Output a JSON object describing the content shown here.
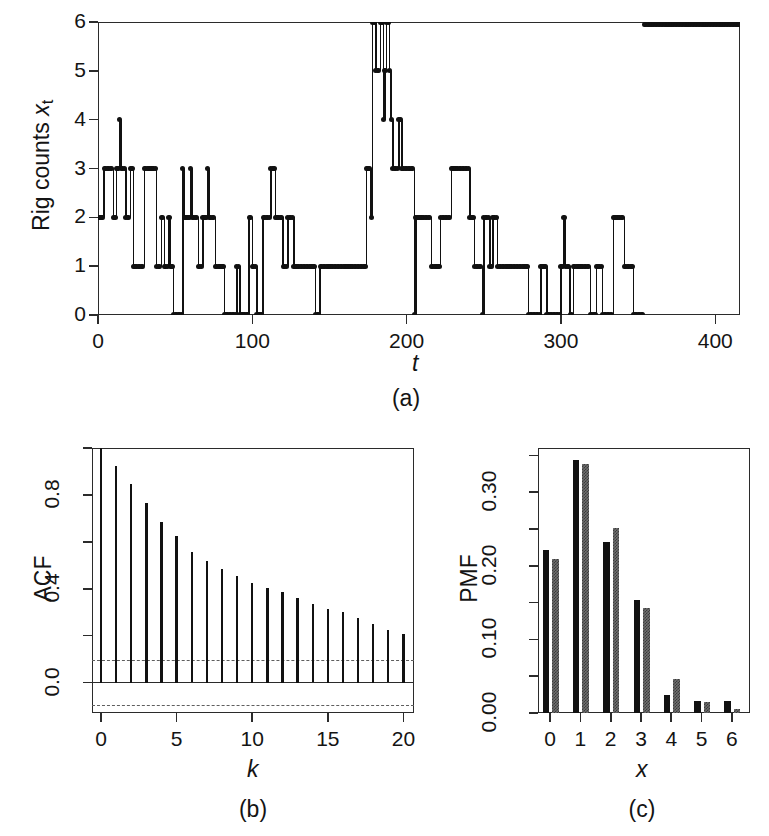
{
  "figure": {
    "panels": [
      "(a)",
      "(b)",
      "(c)"
    ]
  },
  "panel_a": {
    "caption": "(a)",
    "ylabel_main": "Rig counts ",
    "ylabel_var": "x",
    "ylabel_sub": "t",
    "xlabel": "t",
    "yticks": [
      "0",
      "1",
      "2",
      "3",
      "4",
      "5",
      "6"
    ],
    "xticks": [
      "0",
      "100",
      "200",
      "300",
      "400"
    ]
  },
  "panel_b": {
    "caption": "(b)",
    "ylabel": "ACF",
    "xlabel": "k",
    "yticks": [
      "0.0",
      "0.4",
      "0.8"
    ],
    "xticks": [
      "0",
      "5",
      "10",
      "15",
      "20"
    ]
  },
  "panel_c": {
    "caption": "(c)",
    "ylabel": "PMF",
    "xlabel": "x",
    "yticks": [
      "0.00",
      "0.10",
      "0.20",
      "0.30"
    ],
    "xticks": [
      "0",
      "1",
      "2",
      "3",
      "4",
      "5",
      "6"
    ]
  },
  "colors": {
    "observed": "#111111",
    "fitted": "#6f6f6f",
    "axis": "#2b2b2b",
    "confidence": "#5e5e5e",
    "background": "#ffffff"
  },
  "chart_data": [
    {
      "type": "line",
      "id": "rig-counts-time-series",
      "title": "",
      "xlabel": "t",
      "ylabel": "Rig counts x_t",
      "xlim": [
        0,
        416
      ],
      "ylim": [
        0,
        6
      ],
      "grid": false,
      "legend": "none",
      "style": "stem-with-points",
      "x": [
        1,
        2,
        3,
        4,
        5,
        6,
        7,
        8,
        9,
        10,
        11,
        12,
        13,
        14,
        15,
        16,
        17,
        18,
        19,
        20,
        21,
        22,
        23,
        24,
        25,
        26,
        27,
        28,
        29,
        30,
        31,
        32,
        33,
        34,
        35,
        36,
        37,
        38,
        39,
        40,
        41,
        42,
        43,
        44,
        45,
        46,
        47,
        48,
        49,
        50,
        51,
        52,
        53,
        54,
        55,
        56,
        57,
        58,
        59,
        60,
        61,
        62,
        63,
        64,
        65,
        66,
        67,
        68,
        69,
        70,
        71,
        72,
        73,
        74,
        75,
        76,
        77,
        78,
        79,
        80,
        81,
        82,
        83,
        84,
        85,
        86,
        87,
        88,
        89,
        90,
        91,
        92,
        93,
        94,
        95,
        96,
        97,
        98,
        99,
        100,
        101,
        102,
        103,
        104,
        105,
        106,
        107,
        108,
        109,
        110,
        111,
        112,
        113,
        114,
        115,
        116,
        117,
        118,
        119,
        120,
        121,
        122,
        123,
        124,
        125,
        126,
        127,
        128,
        129,
        130,
        131,
        132,
        133,
        134,
        135,
        136,
        137,
        138,
        139,
        140,
        141,
        142,
        143,
        144,
        145,
        146,
        147,
        148,
        149,
        150,
        151,
        152,
        153,
        154,
        155,
        156,
        157,
        158,
        159,
        160,
        161,
        162,
        163,
        164,
        165,
        166,
        167,
        168,
        169,
        170,
        171,
        172,
        173,
        174,
        175,
        176,
        177,
        178,
        179,
        180,
        181,
        182,
        183,
        184,
        185,
        186,
        187,
        188,
        189,
        190,
        191,
        192,
        193,
        194,
        195,
        196,
        197,
        198,
        199,
        200,
        201,
        202,
        203,
        204,
        205,
        206,
        207,
        208,
        209,
        210,
        211,
        212,
        213,
        214,
        215,
        216,
        217,
        218,
        219,
        220,
        221,
        222,
        223,
        224,
        225,
        226,
        227,
        228,
        229,
        230,
        231,
        232,
        233,
        234,
        235,
        236,
        237,
        238,
        239,
        240,
        241,
        242,
        243,
        244,
        245,
        246,
        247,
        248,
        249,
        250,
        251,
        252,
        253,
        254,
        255,
        256,
        257,
        258,
        259,
        260,
        261,
        262,
        263,
        264,
        265,
        266,
        267,
        268,
        269,
        270,
        271,
        272,
        273,
        274,
        275,
        276,
        277,
        278,
        279,
        280,
        281,
        282,
        283,
        284,
        285,
        286,
        287,
        288,
        289,
        290,
        291,
        292,
        293,
        294,
        295,
        296,
        297,
        298,
        299,
        300,
        301,
        302,
        303,
        304,
        305,
        306,
        307,
        308,
        309,
        310,
        311,
        312,
        313,
        314,
        315,
        316,
        317,
        318,
        319,
        320,
        321,
        322,
        323,
        324,
        325,
        326,
        327,
        328,
        329,
        330,
        331,
        332,
        333,
        334,
        335,
        336,
        337,
        338,
        339,
        340,
        341,
        342,
        343,
        344,
        345,
        346,
        347,
        348,
        349,
        350,
        351,
        352,
        353,
        354,
        355,
        356,
        357,
        358,
        359,
        360,
        361,
        362,
        363,
        364,
        365,
        366,
        367,
        368,
        369,
        370,
        371,
        372,
        373,
        374,
        375,
        376,
        377,
        378,
        379,
        380,
        381,
        382,
        383,
        384,
        385,
        386,
        387,
        388,
        389,
        390,
        391,
        392,
        393,
        394,
        395,
        396,
        397,
        398,
        399,
        400,
        401,
        402,
        403,
        404,
        405,
        406,
        407,
        408,
        409,
        410,
        411,
        412,
        413,
        414,
        415,
        416
      ],
      "y": [
        2,
        2,
        2,
        3,
        3,
        3,
        3,
        3,
        3,
        2,
        2,
        3,
        3,
        4,
        3,
        3,
        3,
        2,
        2,
        2,
        3,
        3,
        1,
        1,
        1,
        1,
        1,
        1,
        1,
        3,
        3,
        3,
        3,
        3,
        3,
        3,
        3,
        1,
        1,
        1,
        2,
        2,
        1,
        1,
        1,
        2,
        1,
        1,
        0,
        0,
        0,
        0,
        0,
        0,
        3,
        2,
        2,
        2,
        2,
        3,
        2,
        2,
        2,
        2,
        1,
        1,
        1,
        2,
        2,
        2,
        3,
        2,
        2,
        2,
        2,
        1,
        1,
        1,
        1,
        1,
        1,
        0,
        0,
        0,
        0,
        0,
        0,
        0,
        0,
        1,
        1,
        0,
        0,
        0,
        0,
        0,
        0,
        2,
        2,
        1,
        1,
        1,
        0,
        0,
        0,
        0,
        2,
        2,
        2,
        2,
        2,
        3,
        3,
        3,
        2,
        2,
        2,
        2,
        2,
        1,
        1,
        1,
        2,
        2,
        2,
        2,
        1,
        1,
        1,
        1,
        1,
        1,
        1,
        1,
        1,
        1,
        1,
        1,
        1,
        1,
        0,
        0,
        0,
        1,
        1,
        1,
        1,
        1,
        1,
        1,
        1,
        1,
        1,
        1,
        1,
        1,
        1,
        1,
        1,
        1,
        1,
        1,
        1,
        1,
        1,
        1,
        1,
        1,
        1,
        1,
        1,
        1,
        1,
        3,
        3,
        3,
        2,
        6,
        6,
        5,
        5,
        5,
        6,
        6,
        4,
        5,
        6,
        6,
        5,
        4,
        3,
        3,
        3,
        3,
        4,
        4,
        3,
        3,
        3,
        3,
        3,
        3,
        3,
        3,
        0,
        2,
        2,
        2,
        2,
        2,
        2,
        2,
        2,
        2,
        2,
        1,
        1,
        1,
        1,
        1,
        1,
        2,
        2,
        2,
        2,
        2,
        2,
        2,
        3,
        3,
        3,
        3,
        3,
        3,
        3,
        3,
        3,
        3,
        3,
        3,
        2,
        2,
        2,
        1,
        1,
        1,
        1,
        1,
        0,
        2,
        2,
        2,
        2,
        1,
        1,
        2,
        2,
        2,
        1,
        1,
        1,
        1,
        1,
        1,
        1,
        1,
        1,
        1,
        1,
        1,
        1,
        1,
        1,
        1,
        1,
        1,
        1,
        1,
        0,
        0,
        0,
        0,
        0,
        0,
        0,
        0,
        1,
        1,
        1,
        1,
        0,
        0,
        0,
        0,
        0,
        0,
        0,
        0,
        0,
        1,
        1,
        2,
        1,
        1,
        1,
        0,
        0,
        1,
        1,
        1,
        1,
        1,
        1,
        1,
        1,
        1,
        1,
        1,
        0,
        0,
        0,
        0,
        1,
        1,
        1,
        1,
        0,
        0,
        0,
        0,
        0,
        0,
        0,
        2,
        2,
        2,
        2,
        2,
        2,
        2,
        1,
        1,
        1,
        1,
        1,
        1,
        0,
        0,
        0,
        0,
        0,
        0,
        0
      ]
    },
    {
      "type": "bar",
      "id": "acf-correlogram",
      "title": "",
      "xlabel": "k",
      "ylabel": "ACF",
      "xlim": [
        0,
        20
      ],
      "ylim": [
        -0.13,
        1.0
      ],
      "grid": false,
      "legend": "none",
      "style": "stem",
      "categories": [
        0,
        1,
        2,
        3,
        4,
        5,
        6,
        7,
        8,
        9,
        10,
        11,
        12,
        13,
        14,
        15,
        16,
        17,
        18,
        19,
        20
      ],
      "values": [
        1.0,
        0.925,
        0.845,
        0.765,
        0.685,
        0.625,
        0.555,
        0.52,
        0.485,
        0.455,
        0.425,
        0.405,
        0.385,
        0.36,
        0.335,
        0.315,
        0.3,
        0.275,
        0.25,
        0.225,
        0.205
      ],
      "confidence_bounds": [
        0.096,
        -0.096
      ],
      "confidence_style": "dashed"
    },
    {
      "type": "bar",
      "id": "pmf-observed-vs-fitted",
      "title": "",
      "xlabel": "x",
      "ylabel": "PMF",
      "xlim": [
        -0.5,
        6.5
      ],
      "ylim": [
        0,
        0.36
      ],
      "grid": false,
      "legend": "none",
      "categories": [
        "0",
        "1",
        "2",
        "3",
        "4",
        "5",
        "6"
      ],
      "series": [
        {
          "name": "observed",
          "values": [
            0.221,
            0.344,
            0.233,
            0.154,
            0.024,
            0.017,
            0.017
          ]
        },
        {
          "name": "fitted",
          "values": [
            0.209,
            0.338,
            0.251,
            0.143,
            0.046,
            0.015,
            0.005
          ]
        }
      ]
    }
  ]
}
